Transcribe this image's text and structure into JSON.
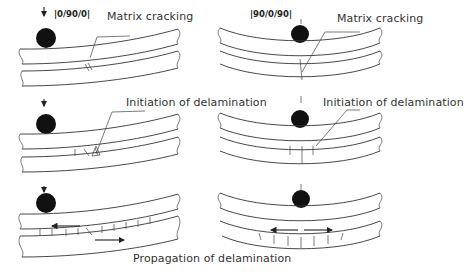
{
  "figure": {
    "columns": [
      {
        "id": "left",
        "layup": "|0/90/0|"
      },
      {
        "id": "right",
        "layup": "|90/0/90|"
      }
    ],
    "rows": [
      {
        "stage": 1,
        "left_label": "Matrix cracking",
        "right_label": "Matrix cracking"
      },
      {
        "stage": 2,
        "left_label": "Initiation of delamination",
        "right_label": "Initiation of delamination"
      },
      {
        "stage": 3,
        "shared_label": "Propagation of delamination"
      }
    ],
    "colors": {
      "line": "#333333",
      "ball": "#111111",
      "background": "#ffffff"
    }
  }
}
